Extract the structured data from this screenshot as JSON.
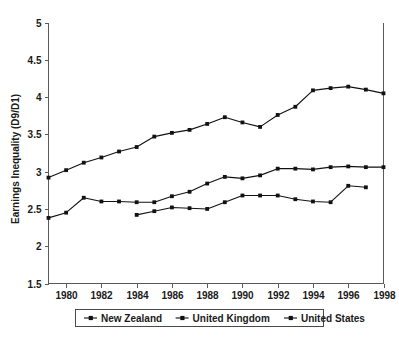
{
  "chart_data": {
    "type": "line",
    "title": "",
    "subtitle": "",
    "xlabel": "",
    "ylabel": "Earnings Inequality (D9/D1)",
    "xlim": [
      1979,
      1998
    ],
    "ylim": [
      1.5,
      5
    ],
    "grid": false,
    "legend_position": "bottom",
    "x_ticks": [
      "1980",
      "1982",
      "1984",
      "1986",
      "1988",
      "1990",
      "1992",
      "1994",
      "1996",
      "1998"
    ],
    "x_tick_values": [
      1980,
      1982,
      1984,
      1986,
      1988,
      1990,
      1992,
      1994,
      1996,
      1998
    ],
    "y_ticks": [
      "1.5",
      "2",
      "2.5",
      "3",
      "3.5",
      "4",
      "4.5",
      "5"
    ],
    "y_tick_values": [
      1.5,
      2,
      2.5,
      3,
      3.5,
      4,
      4.5,
      5
    ],
    "marker": "square",
    "line_color": "#111111",
    "series": [
      {
        "name": "New Zealand",
        "x": [
          1979,
          1980,
          1981,
          1982,
          1983,
          1984,
          1985,
          1986,
          1987,
          1988,
          1989,
          1990,
          1991,
          1992,
          1993,
          1994,
          1995,
          1996,
          1997,
          1998
        ],
        "values": [
          2.92,
          3.02,
          3.12,
          3.19,
          3.27,
          3.33,
          3.47,
          3.52,
          3.56,
          3.64,
          3.73,
          3.66,
          3.6,
          3.76,
          3.87,
          4.09,
          4.12,
          4.14,
          4.1,
          4.05
        ]
      },
      {
        "name": "United Kingdom",
        "x": [
          1979,
          1980,
          1981,
          1982,
          1983,
          1984,
          1985,
          1986,
          1987,
          1988,
          1989,
          1990,
          1991,
          1992,
          1993,
          1994,
          1995,
          1996,
          1997,
          1998
        ],
        "values": [
          2.38,
          2.45,
          2.65,
          2.6,
          2.6,
          2.59,
          2.59,
          2.67,
          2.73,
          2.84,
          2.93,
          2.91,
          2.95,
          3.04,
          3.04,
          3.03,
          3.06,
          3.07,
          3.06,
          3.06
        ]
      },
      {
        "name": "United States",
        "x": [
          1984,
          1985,
          1986,
          1987,
          1988,
          1989,
          1990,
          1991,
          1992,
          1993,
          1994,
          1995,
          1996,
          1997
        ],
        "values": [
          2.42,
          2.47,
          2.52,
          2.51,
          2.5,
          2.59,
          2.68,
          2.68,
          2.68,
          2.63,
          2.6,
          2.59,
          2.81,
          2.79
        ]
      }
    ]
  },
  "legend": {
    "items": [
      {
        "label": "New Zealand"
      },
      {
        "label": "United Kingdom"
      },
      {
        "label": "United States"
      }
    ]
  },
  "axes": {
    "y_title": "Earnings Inequality (D9/D1)"
  }
}
